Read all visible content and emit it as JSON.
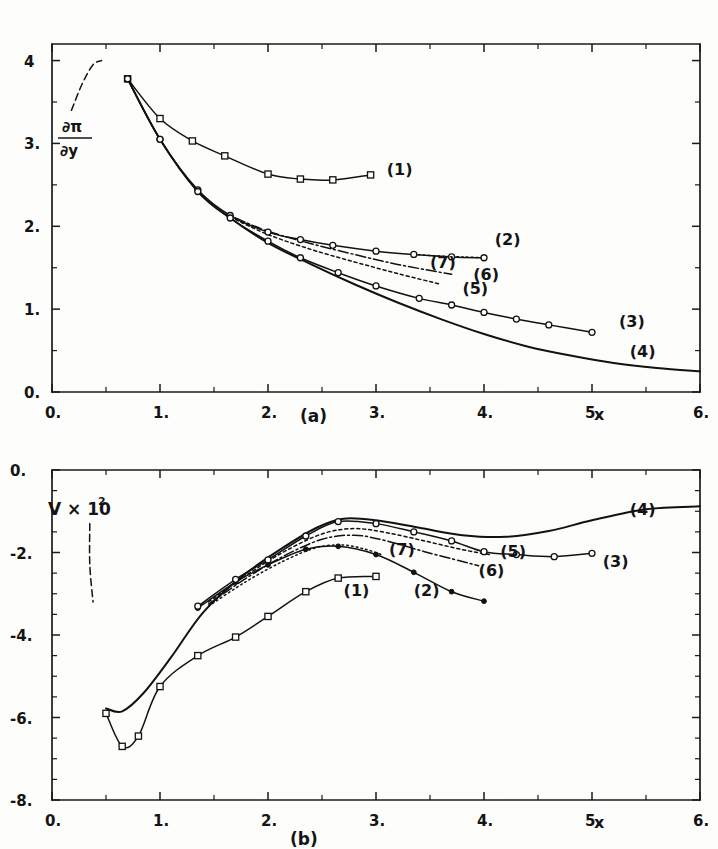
{
  "figure": {
    "title_a": "(a)",
    "title_b": "(b)",
    "background": "#fdfdfc",
    "ink": "#141414"
  },
  "panel_a": {
    "caption": "(a)",
    "xaxis_name": "x",
    "yaxis_numerator": "∂π",
    "yaxis_denominator": "∂y",
    "xticks": [
      "0.",
      "1.",
      "2.",
      "3.",
      "4.",
      "5.",
      "6."
    ],
    "yticks": [
      "0.",
      "1.",
      "2.",
      "3.",
      "4"
    ],
    "curve_labels": [
      "(1)",
      "(2)",
      "(3)",
      "(4)",
      "(5)",
      "(6)",
      "(7)"
    ]
  },
  "panel_b": {
    "caption": "(b)",
    "xaxis_name": "x",
    "yaxis_label": "V × 10",
    "yaxis_exponent": "2",
    "xticks": [
      "0.",
      "1.",
      "2.",
      "3.",
      "4.",
      "5.",
      "6."
    ],
    "yticks": [
      "-8.",
      "-6.",
      "-4.",
      "-2.",
      "0."
    ],
    "curve_labels": [
      "(1)",
      "(2)",
      "(3)",
      "(4)",
      "(5)",
      "(6)",
      "(7)"
    ]
  },
  "chart_data": [
    {
      "type": "line",
      "panel": "(a)",
      "title": "(a)",
      "xlabel": "x",
      "ylabel": "∂π/∂y",
      "xlim": [
        0,
        6
      ],
      "ylim": [
        0,
        4.2
      ],
      "xticks": [
        0,
        1,
        2,
        3,
        4,
        5,
        6
      ],
      "yticks": [
        0,
        1,
        2,
        3,
        4
      ],
      "minor_ticks": true,
      "grid": false,
      "legend": "inline-curve-labels",
      "series": [
        {
          "name": "(1)",
          "style": "solid",
          "marker": "open-square",
          "x": [
            0.7,
            1.0,
            1.3,
            1.6,
            2.0,
            2.3,
            2.6,
            2.95
          ],
          "y": [
            3.78,
            3.3,
            3.03,
            2.85,
            2.63,
            2.57,
            2.56,
            2.62
          ]
        },
        {
          "name": "(2)",
          "style": "solid",
          "marker": "open-circle",
          "x": [
            0.7,
            1.0,
            1.35,
            1.65,
            2.0,
            2.3,
            2.6,
            3.0,
            3.35,
            3.7,
            4.0
          ],
          "y": [
            3.78,
            3.05,
            2.44,
            2.13,
            1.93,
            1.84,
            1.77,
            1.7,
            1.66,
            1.63,
            1.62
          ]
        },
        {
          "name": "(3)",
          "style": "solid",
          "marker": "open-circle",
          "x": [
            0.7,
            1.0,
            1.35,
            1.65,
            2.0,
            2.3,
            2.65,
            3.0,
            3.4,
            3.7,
            4.0,
            4.3,
            4.6,
            5.0
          ],
          "y": [
            3.78,
            3.05,
            2.42,
            2.1,
            1.82,
            1.62,
            1.44,
            1.28,
            1.13,
            1.05,
            0.96,
            0.88,
            0.81,
            0.72
          ]
        },
        {
          "name": "(4)",
          "style": "solid",
          "marker": "none",
          "x": [
            0.7,
            1.0,
            1.35,
            1.65,
            2.0,
            2.4,
            2.8,
            3.2,
            3.6,
            4.0,
            4.4,
            4.8,
            5.2,
            5.6,
            6.0
          ],
          "y": [
            3.78,
            3.05,
            2.42,
            2.1,
            1.8,
            1.54,
            1.3,
            1.08,
            0.88,
            0.7,
            0.55,
            0.44,
            0.35,
            0.29,
            0.25
          ]
        },
        {
          "name": "(5)",
          "style": "short-dash",
          "marker": "none",
          "x": [
            1.7,
            2.0,
            2.4,
            2.8,
            3.2,
            3.6
          ],
          "y": [
            2.08,
            1.9,
            1.72,
            1.57,
            1.43,
            1.3
          ]
        },
        {
          "name": "(6)",
          "style": "dash-dot",
          "marker": "none",
          "x": [
            1.7,
            2.0,
            2.4,
            2.8,
            3.2,
            3.7
          ],
          "y": [
            2.1,
            1.94,
            1.79,
            1.66,
            1.54,
            1.42
          ]
        },
        {
          "name": "(7)",
          "style": "dotted",
          "marker": "none",
          "x": [
            3.35,
            3.6,
            3.8,
            4.0
          ],
          "y": [
            1.66,
            1.64,
            1.63,
            1.62
          ]
        }
      ],
      "annotations": [
        {
          "text": "(1)",
          "x": 3.1,
          "y": 2.62
        },
        {
          "text": "(2)",
          "x": 4.1,
          "y": 1.78
        },
        {
          "text": "(7)",
          "x": 3.5,
          "y": 1.5
        },
        {
          "text": "(6)",
          "x": 3.9,
          "y": 1.35
        },
        {
          "text": "(5)",
          "x": 3.8,
          "y": 1.18
        },
        {
          "text": "(3)",
          "x": 5.25,
          "y": 0.78
        },
        {
          "text": "(4)",
          "x": 5.35,
          "y": 0.42
        }
      ],
      "dashed_lead_in": {
        "x": [
          0.18,
          0.28,
          0.38,
          0.46
        ],
        "y": [
          3.4,
          3.72,
          3.95,
          4.0
        ]
      }
    },
    {
      "type": "line",
      "panel": "(b)",
      "title": "(b)",
      "xlabel": "x",
      "ylabel": "V × 10^2",
      "xlim": [
        0,
        6
      ],
      "ylim": [
        -8,
        0
      ],
      "xticks": [
        0,
        1,
        2,
        3,
        4,
        5,
        6
      ],
      "yticks": [
        -8,
        -6,
        -4,
        -2,
        0
      ],
      "minor_ticks": true,
      "grid": false,
      "legend": "inline-curve-labels",
      "series": [
        {
          "name": "(1)",
          "style": "solid",
          "marker": "open-square",
          "x": [
            0.5,
            0.65,
            0.8,
            1.0,
            1.35,
            1.7,
            2.0,
            2.35,
            2.65,
            3.0
          ],
          "y": [
            -5.9,
            -6.7,
            -6.45,
            -5.25,
            -4.5,
            -4.05,
            -3.55,
            -2.95,
            -2.62,
            -2.58
          ]
        },
        {
          "name": "(2)",
          "style": "solid",
          "marker": "filled-circle",
          "x": [
            1.35,
            1.7,
            2.0,
            2.35,
            2.65,
            3.0,
            3.35,
            3.7,
            4.0
          ],
          "y": [
            -3.35,
            -2.72,
            -2.3,
            -1.92,
            -1.85,
            -2.05,
            -2.48,
            -2.95,
            -3.18
          ]
        },
        {
          "name": "(3)",
          "style": "solid",
          "marker": "open-circle",
          "x": [
            1.35,
            1.7,
            2.0,
            2.35,
            2.65,
            3.0,
            3.35,
            3.7,
            4.0,
            4.3,
            4.65,
            5.0
          ],
          "y": [
            -3.3,
            -2.65,
            -2.18,
            -1.6,
            -1.25,
            -1.3,
            -1.5,
            -1.72,
            -1.98,
            -2.05,
            -2.1,
            -2.02
          ]
        },
        {
          "name": "(4)",
          "style": "solid",
          "marker": "none",
          "x": [
            0.5,
            0.65,
            0.85,
            1.1,
            1.4,
            1.75,
            2.1,
            2.45,
            2.7,
            3.0,
            3.4,
            3.8,
            4.2,
            4.6,
            5.0,
            5.5,
            6.0
          ],
          "y": [
            -5.78,
            -5.85,
            -5.4,
            -4.55,
            -3.45,
            -2.6,
            -1.95,
            -1.4,
            -1.18,
            -1.22,
            -1.4,
            -1.58,
            -1.62,
            -1.48,
            -1.22,
            -0.95,
            -0.88
          ]
        },
        {
          "name": "(5)",
          "style": "short-dash",
          "marker": "none",
          "x": [
            1.45,
            1.8,
            2.15,
            2.5,
            2.8,
            3.1,
            3.45,
            3.8,
            4.05
          ],
          "y": [
            -3.2,
            -2.55,
            -1.98,
            -1.55,
            -1.42,
            -1.52,
            -1.72,
            -1.93,
            -2.05
          ]
        },
        {
          "name": "(6)",
          "style": "dash-dot",
          "marker": "none",
          "x": [
            1.45,
            1.8,
            2.15,
            2.5,
            2.8,
            3.1,
            3.45,
            3.8,
            3.95
          ],
          "y": [
            -3.25,
            -2.62,
            -2.08,
            -1.68,
            -1.58,
            -1.72,
            -1.98,
            -2.22,
            -2.32
          ]
        },
        {
          "name": "(7)",
          "style": "dotted",
          "marker": "none",
          "x": [
            1.45,
            1.8,
            2.15,
            2.45,
            2.7,
            2.9,
            3.05
          ],
          "y": [
            -3.3,
            -2.7,
            -2.2,
            -1.88,
            -1.82,
            -1.92,
            -2.05
          ]
        }
      ],
      "annotations": [
        {
          "text": "(1)",
          "x": 2.7,
          "y": -3.05
        },
        {
          "text": "(2)",
          "x": 3.35,
          "y": -3.05
        },
        {
          "text": "(3)",
          "x": 5.1,
          "y": -2.35
        },
        {
          "text": "(4)",
          "x": 5.35,
          "y": -1.1
        },
        {
          "text": "(5)",
          "x": 4.15,
          "y": -2.1
        },
        {
          "text": "(6)",
          "x": 3.95,
          "y": -2.58
        },
        {
          "text": "(7)",
          "x": 3.12,
          "y": -2.05
        }
      ],
      "dashed_lead_in": {
        "x": [
          0.35,
          0.35,
          0.38
        ],
        "y": [
          -1.3,
          -2.3,
          -3.2
        ]
      }
    }
  ]
}
